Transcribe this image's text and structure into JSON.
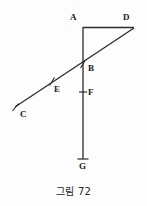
{
  "figure": {
    "caption": "그림 72",
    "stroke_color": "#2b2b2b",
    "background_color": "#fdfdfd",
    "type": "geometry-diagram",
    "points": [
      {
        "id": "A",
        "label": "A",
        "x": 83,
        "y": 27,
        "label_x": 70,
        "label_y": 13
      },
      {
        "id": "D",
        "label": "D",
        "x": 134,
        "y": 28,
        "label_x": 123,
        "label_y": 13
      },
      {
        "id": "B",
        "label": "B",
        "x": 83,
        "y": 64,
        "label_x": 88,
        "label_y": 64
      },
      {
        "id": "E",
        "label": "E",
        "x": 52,
        "y": 81,
        "label_x": 54,
        "label_y": 85
      },
      {
        "id": "F",
        "label": "F",
        "x": 83,
        "y": 92,
        "label_x": 88,
        "label_y": 88
      },
      {
        "id": "C",
        "label": "C",
        "x": 15,
        "y": 107,
        "label_x": 20,
        "label_y": 110
      },
      {
        "id": "G",
        "label": "G",
        "x": 83,
        "y": 159,
        "label_x": 79,
        "label_y": 162
      }
    ],
    "segments": [
      {
        "name": "segment-A-G-vertical",
        "from": "A",
        "to": "G"
      },
      {
        "name": "segment-A-D-horizontal",
        "from": "A",
        "to": "D"
      },
      {
        "name": "segment-C-D-diagonal",
        "from": "C",
        "to": "D"
      }
    ],
    "tick_marks": [
      {
        "name": "tick-at-E",
        "x": 52,
        "y": 81
      },
      {
        "name": "tick-at-F",
        "x": 83,
        "y": 92
      },
      {
        "name": "tick-at-B",
        "x": 83,
        "y": 64
      },
      {
        "name": "tick-at-G",
        "x": 83,
        "y": 159
      },
      {
        "name": "tick-at-C",
        "x": 15,
        "y": 107
      }
    ]
  }
}
